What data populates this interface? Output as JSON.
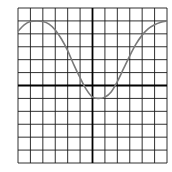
{
  "chart_data": {
    "type": "line",
    "title": "",
    "xlabel": "",
    "ylabel": "",
    "xlim": [
      -6,
      6
    ],
    "ylim": [
      -6,
      6
    ],
    "grid": true,
    "grid_step": 1,
    "axes_through_origin": true,
    "series": [
      {
        "name": "f(x)",
        "x": [
          -6,
          -5.5,
          -5,
          -4.5,
          -4,
          -3.5,
          -3,
          -2.5,
          -2,
          -1.5,
          -1,
          -0.5,
          0,
          0.5,
          1,
          1.5,
          2,
          2.5,
          3,
          3.5,
          4,
          4.5,
          5,
          5.5,
          6
        ],
        "values": [
          4.2,
          4.7,
          4.95,
          5.0,
          4.95,
          4.75,
          4.3,
          3.6,
          2.7,
          1.6,
          0.6,
          -0.3,
          -0.9,
          -1.0,
          -0.9,
          -0.5,
          0.3,
          1.3,
          2.3,
          3.2,
          3.9,
          4.4,
          4.7,
          4.9,
          5.0
        ]
      }
    ]
  },
  "colors": {
    "grid": "#1a1a1a",
    "axis": "#000000",
    "curve": "#7a7a7a",
    "background": "#ffffff"
  }
}
